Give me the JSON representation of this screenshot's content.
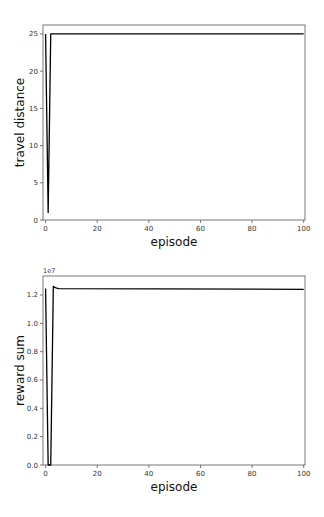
{
  "chart_data": [
    {
      "type": "line",
      "title": "",
      "xlabel": "episode",
      "ylabel": "travel distance",
      "xlim": [
        -1,
        100.5
      ],
      "ylim": [
        0,
        26.2
      ],
      "xticks": [
        0,
        20,
        40,
        60,
        80,
        100
      ],
      "xtick_labels": [
        "0",
        "20",
        "40",
        "60",
        "80",
        "100"
      ],
      "yticks": [
        0,
        5,
        10,
        15,
        20,
        25
      ],
      "ytick_labels": [
        "0",
        "5",
        "10",
        "15",
        "20",
        "25"
      ],
      "offset_text": "",
      "grid": false,
      "series": [
        {
          "name": "travel distance",
          "color": "#000000",
          "x": [
            0,
            1,
            2,
            3,
            100
          ],
          "y": [
            25,
            1,
            25,
            25,
            25
          ]
        }
      ]
    },
    {
      "type": "line",
      "title": "",
      "xlabel": "episode",
      "ylabel": "reward sum",
      "xlim": [
        -1,
        100.5
      ],
      "ylim": [
        0,
        13340000
      ],
      "xticks": [
        0,
        20,
        40,
        60,
        80,
        100
      ],
      "xtick_labels": [
        "0",
        "20",
        "40",
        "60",
        "80",
        "100"
      ],
      "yticks": [
        0,
        2000000,
        4000000,
        6000000,
        8000000,
        10000000,
        12000000
      ],
      "ytick_labels": [
        "0.0",
        "0.2",
        "0.4",
        "0.6",
        "0.8",
        "1.0",
        "1.2"
      ],
      "offset_text": "1e7",
      "grid": false,
      "series": [
        {
          "name": "reward sum",
          "color": "#000000",
          "x": [
            0,
            1,
            2,
            3,
            4,
            5,
            100
          ],
          "y": [
            12450000,
            0,
            0,
            12600000,
            12500000,
            12450000,
            12400000
          ]
        }
      ]
    }
  ]
}
